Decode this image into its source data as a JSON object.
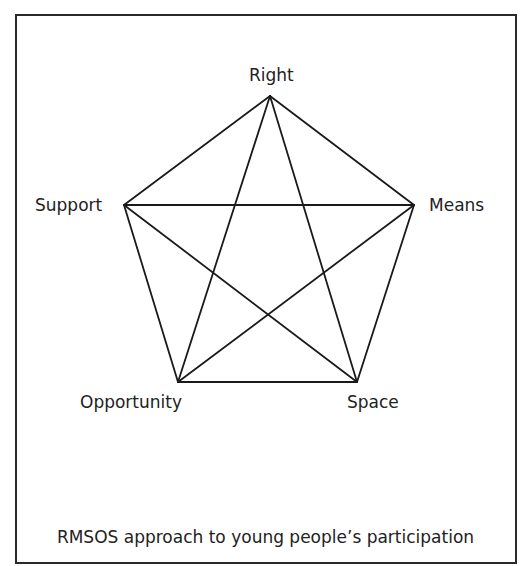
{
  "diagram": {
    "caption": "RMSOS approach to young people’s participation",
    "nodes": [
      {
        "id": "right",
        "label": "Right",
        "x": 270,
        "y": 96
      },
      {
        "id": "means",
        "label": "Means",
        "x": 414,
        "y": 205
      },
      {
        "id": "space",
        "label": "Space",
        "x": 357,
        "y": 382
      },
      {
        "id": "opportunity",
        "label": "Opportunity",
        "x": 178,
        "y": 382
      },
      {
        "id": "support",
        "label": "Support",
        "x": 124,
        "y": 205
      }
    ],
    "edges": [
      [
        "right",
        "means"
      ],
      [
        "means",
        "space"
      ],
      [
        "space",
        "opportunity"
      ],
      [
        "opportunity",
        "support"
      ],
      [
        "support",
        "right"
      ],
      [
        "right",
        "space"
      ],
      [
        "right",
        "opportunity"
      ],
      [
        "means",
        "support"
      ],
      [
        "means",
        "opportunity"
      ],
      [
        "support",
        "space"
      ]
    ],
    "line_color": "#1a1a1a"
  }
}
